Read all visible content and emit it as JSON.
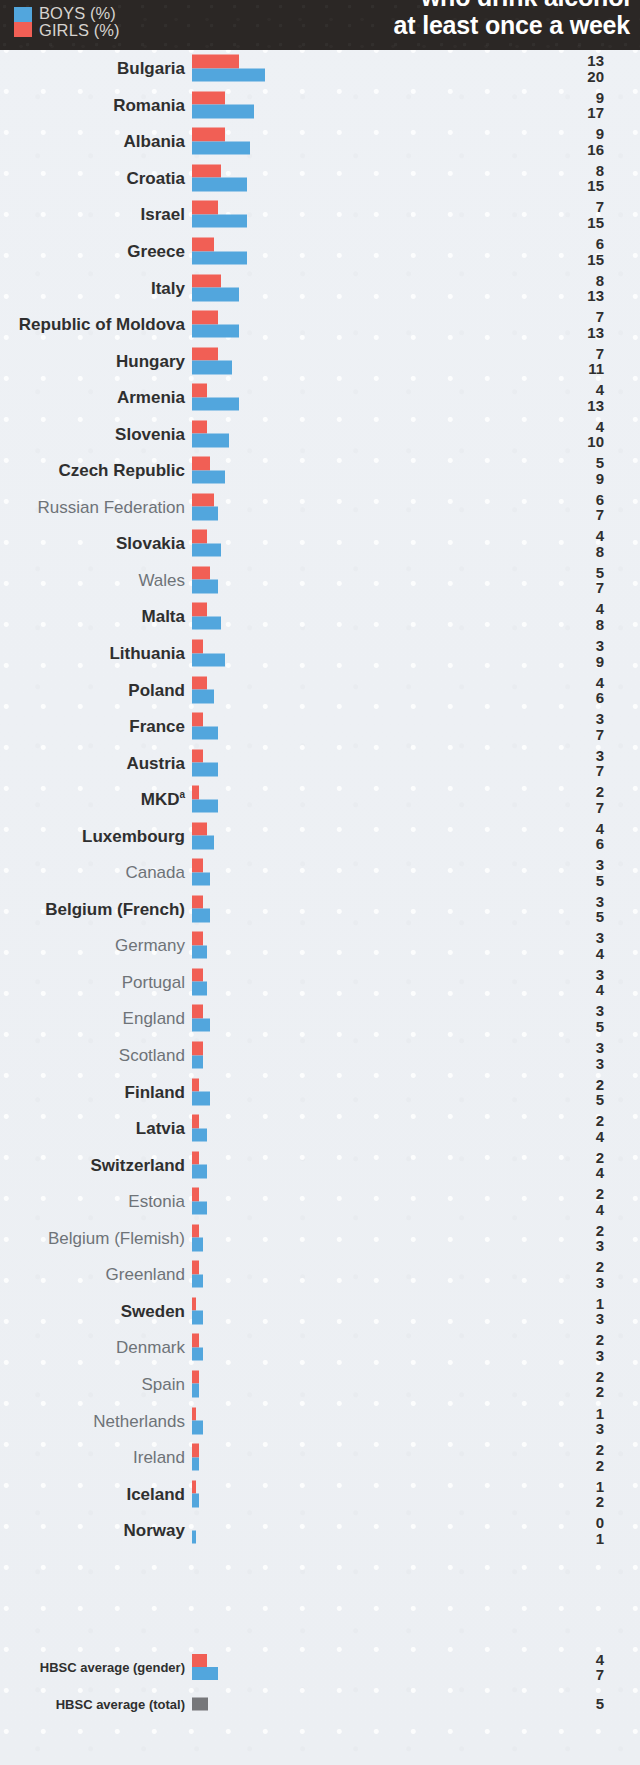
{
  "header": {
    "title_line1": "who drink alcohol",
    "title_line2": "at least once a week",
    "legend": {
      "boys_label": "BOYS (%)",
      "girls_label": "GIRLS (%)",
      "boys_color": "#52a6dd",
      "girls_color": "#f15f55"
    },
    "background_color": "#2b2725"
  },
  "chart_data": {
    "type": "bar",
    "orientation": "horizontal",
    "title": "who drink alcohol at least once a week",
    "xlabel": "",
    "ylabel": "",
    "xlim": [
      0,
      20
    ],
    "grid": false,
    "legend_position": "top-left",
    "value_unit": "%",
    "series": [
      {
        "name": "GIRLS (%)",
        "color": "#f15f55",
        "values": [
          13,
          9,
          9,
          8,
          7,
          6,
          8,
          7,
          7,
          4,
          4,
          5,
          6,
          4,
          5,
          4,
          3,
          4,
          3,
          3,
          2,
          4,
          3,
          3,
          3,
          3,
          3,
          3,
          2,
          2,
          2,
          2,
          2,
          2,
          1,
          2,
          2,
          1,
          2,
          1,
          0
        ]
      },
      {
        "name": "BOYS (%)",
        "color": "#52a6dd",
        "values": [
          20,
          17,
          16,
          15,
          15,
          15,
          13,
          13,
          11,
          13,
          10,
          9,
          7,
          8,
          7,
          8,
          9,
          6,
          7,
          7,
          7,
          6,
          5,
          5,
          4,
          4,
          5,
          3,
          5,
          4,
          4,
          4,
          3,
          3,
          3,
          3,
          2,
          3,
          2,
          2,
          1
        ]
      }
    ],
    "categories": [
      "Bulgaria",
      "Romania",
      "Albania",
      "Croatia",
      "Israel",
      "Greece",
      "Italy",
      "Republic of Moldova",
      "Hungary",
      "Armenia",
      "Slovenia",
      "Czech Republic",
      "Russian Federation",
      "Slovakia",
      "Wales",
      "Malta",
      "Lithuania",
      "Poland",
      "France",
      "Austria",
      "MKD",
      "Luxembourg",
      "Canada",
      "Belgium (French)",
      "Germany",
      "Portugal",
      "England",
      "Scotland",
      "Finland",
      "Latvia",
      "Switzerland",
      "Estonia",
      "Belgium (Flemish)",
      "Greenland",
      "Sweden",
      "Denmark",
      "Spain",
      "Netherlands",
      "Ireland",
      "Iceland",
      "Norway"
    ],
    "rows": [
      {
        "label": "Bulgaria",
        "bold": true,
        "footnote": "",
        "girls": 13,
        "boys": 20
      },
      {
        "label": "Romania",
        "bold": true,
        "footnote": "",
        "girls": 9,
        "boys": 17
      },
      {
        "label": "Albania",
        "bold": true,
        "footnote": "",
        "girls": 9,
        "boys": 16
      },
      {
        "label": "Croatia",
        "bold": true,
        "footnote": "",
        "girls": 8,
        "boys": 15
      },
      {
        "label": "Israel",
        "bold": true,
        "footnote": "",
        "girls": 7,
        "boys": 15
      },
      {
        "label": "Greece",
        "bold": true,
        "footnote": "",
        "girls": 6,
        "boys": 15
      },
      {
        "label": "Italy",
        "bold": true,
        "footnote": "",
        "girls": 8,
        "boys": 13
      },
      {
        "label": "Republic of Moldova",
        "bold": true,
        "footnote": "",
        "girls": 7,
        "boys": 13
      },
      {
        "label": "Hungary",
        "bold": true,
        "footnote": "",
        "girls": 7,
        "boys": 11
      },
      {
        "label": "Armenia",
        "bold": true,
        "footnote": "",
        "girls": 4,
        "boys": 13
      },
      {
        "label": "Slovenia",
        "bold": true,
        "footnote": "",
        "girls": 4,
        "boys": 10
      },
      {
        "label": "Czech Republic",
        "bold": true,
        "footnote": "",
        "girls": 5,
        "boys": 9
      },
      {
        "label": "Russian Federation",
        "bold": false,
        "footnote": "",
        "girls": 6,
        "boys": 7
      },
      {
        "label": "Slovakia",
        "bold": true,
        "footnote": "",
        "girls": 4,
        "boys": 8
      },
      {
        "label": "Wales",
        "bold": false,
        "footnote": "",
        "girls": 5,
        "boys": 7
      },
      {
        "label": "Malta",
        "bold": true,
        "footnote": "",
        "girls": 4,
        "boys": 8
      },
      {
        "label": "Lithuania",
        "bold": true,
        "footnote": "",
        "girls": 3,
        "boys": 9
      },
      {
        "label": "Poland",
        "bold": true,
        "footnote": "",
        "girls": 4,
        "boys": 6
      },
      {
        "label": "France",
        "bold": true,
        "footnote": "",
        "girls": 3,
        "boys": 7
      },
      {
        "label": "Austria",
        "bold": true,
        "footnote": "",
        "girls": 3,
        "boys": 7
      },
      {
        "label": "MKD",
        "bold": true,
        "footnote": "a",
        "girls": 2,
        "boys": 7
      },
      {
        "label": "Luxembourg",
        "bold": true,
        "footnote": "",
        "girls": 4,
        "boys": 6
      },
      {
        "label": "Canada",
        "bold": false,
        "footnote": "",
        "girls": 3,
        "boys": 5
      },
      {
        "label": "Belgium (French)",
        "bold": true,
        "footnote": "",
        "girls": 3,
        "boys": 5
      },
      {
        "label": "Germany",
        "bold": false,
        "footnote": "",
        "girls": 3,
        "boys": 4
      },
      {
        "label": "Portugal",
        "bold": false,
        "footnote": "",
        "girls": 3,
        "boys": 4
      },
      {
        "label": "England",
        "bold": false,
        "footnote": "",
        "girls": 3,
        "boys": 5
      },
      {
        "label": "Scotland",
        "bold": false,
        "footnote": "",
        "girls": 3,
        "boys": 3
      },
      {
        "label": "Finland",
        "bold": true,
        "footnote": "",
        "girls": 2,
        "boys": 5
      },
      {
        "label": "Latvia",
        "bold": true,
        "footnote": "",
        "girls": 2,
        "boys": 4
      },
      {
        "label": "Switzerland",
        "bold": true,
        "footnote": "",
        "girls": 2,
        "boys": 4
      },
      {
        "label": "Estonia",
        "bold": false,
        "footnote": "",
        "girls": 2,
        "boys": 4
      },
      {
        "label": "Belgium (Flemish)",
        "bold": false,
        "footnote": "",
        "girls": 2,
        "boys": 3
      },
      {
        "label": "Greenland",
        "bold": false,
        "footnote": "",
        "girls": 2,
        "boys": 3
      },
      {
        "label": "Sweden",
        "bold": true,
        "footnote": "",
        "girls": 1,
        "boys": 3
      },
      {
        "label": "Denmark",
        "bold": false,
        "footnote": "",
        "girls": 2,
        "boys": 3
      },
      {
        "label": "Spain",
        "bold": false,
        "footnote": "",
        "girls": 2,
        "boys": 2
      },
      {
        "label": "Netherlands",
        "bold": false,
        "footnote": "",
        "girls": 1,
        "boys": 3
      },
      {
        "label": "Ireland",
        "bold": false,
        "footnote": "",
        "girls": 2,
        "boys": 2
      },
      {
        "label": "Iceland",
        "bold": true,
        "footnote": "",
        "girls": 1,
        "boys": 2
      },
      {
        "label": "Norway",
        "bold": true,
        "footnote": "",
        "girls": 0,
        "boys": 1
      }
    ],
    "averages": [
      {
        "label": "HBSC average (gender)",
        "girls": 4,
        "boys": 7
      },
      {
        "label": "HBSC average (total)",
        "total": 5
      }
    ]
  }
}
